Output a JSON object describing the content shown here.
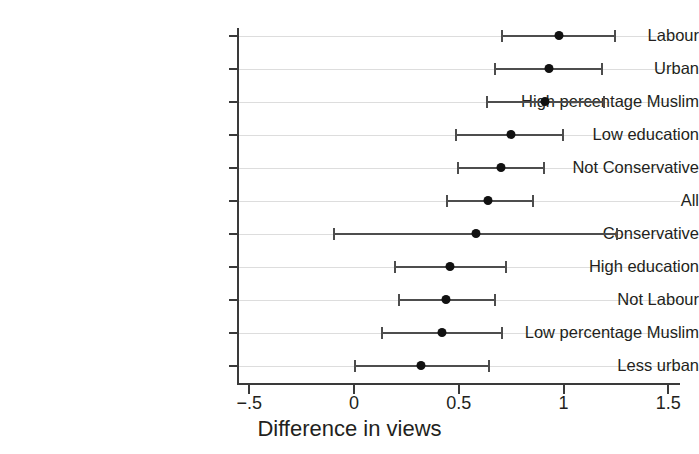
{
  "chart_data": {
    "type": "scatter",
    "subtype": "forest-plot",
    "title": "",
    "xlabel": "Difference in views",
    "ylabel": "",
    "xlim": [
      -0.5,
      1.5
    ],
    "xticks": [
      -0.5,
      0,
      0.5,
      1,
      1.5
    ],
    "xticklabels": [
      "−.5",
      "0",
      "0.5",
      "1",
      "1.5"
    ],
    "grid": "horizontal",
    "legend": "none",
    "marker_color": "#111111",
    "interval_color": "#4d4d4d",
    "axis_color": "#3a3a3a",
    "gridline_color": "#dddddd",
    "categories": [
      "Labour",
      "Urban",
      "High percentage Muslim",
      "Low education",
      "Not Conservative",
      "All",
      "Conservative",
      "High education",
      "Not Labour",
      "Low percentage Muslim",
      "Less urban"
    ],
    "points": [
      {
        "label": "Labour",
        "estimate": 0.98,
        "lower": 0.7,
        "upper": 1.25
      },
      {
        "label": "Urban",
        "estimate": 0.93,
        "lower": 0.67,
        "upper": 1.19
      },
      {
        "label": "High percentage Muslim",
        "estimate": 0.91,
        "lower": 0.63,
        "upper": 1.2
      },
      {
        "label": "Low education",
        "estimate": 0.75,
        "lower": 0.48,
        "upper": 1.0
      },
      {
        "label": "Not Conservative",
        "estimate": 0.7,
        "lower": 0.49,
        "upper": 0.91
      },
      {
        "label": "All",
        "estimate": 0.64,
        "lower": 0.44,
        "upper": 0.86
      },
      {
        "label": "Conservative",
        "estimate": 0.58,
        "lower": -0.1,
        "upper": 1.26
      },
      {
        "label": "High education",
        "estimate": 0.46,
        "lower": 0.19,
        "upper": 0.73
      },
      {
        "label": "Not Labour",
        "estimate": 0.44,
        "lower": 0.21,
        "upper": 0.68
      },
      {
        "label": "Low percentage Muslim",
        "estimate": 0.42,
        "lower": 0.13,
        "upper": 0.71
      },
      {
        "label": "Less urban",
        "estimate": 0.32,
        "lower": 0.0,
        "upper": 0.65
      }
    ]
  }
}
